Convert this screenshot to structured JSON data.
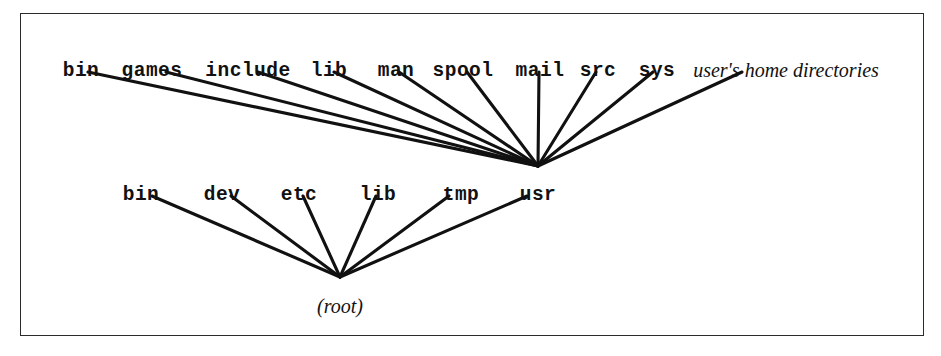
{
  "figure": {
    "frame": {
      "x": 20,
      "y": 13,
      "width": 904,
      "height": 323,
      "border_color": "#2b2b2b"
    },
    "background_color": "#ffffff",
    "line_color": "#111111"
  },
  "chart_data": {
    "type": "diagram",
    "subtype": "tree",
    "orientation": "bottom-up-fan",
    "nodes": [
      {
        "id": "root",
        "label": "(root)",
        "style": "italic-serif",
        "x": 340,
        "y": 296,
        "level": 0
      },
      {
        "id": "bin",
        "label": "bin",
        "style": "mono-bold",
        "x": 141,
        "y": 186,
        "level": 1
      },
      {
        "id": "dev",
        "label": "dev",
        "style": "mono-bold",
        "x": 222,
        "y": 186,
        "level": 1
      },
      {
        "id": "etc",
        "label": "etc",
        "style": "mono-bold",
        "x": 299,
        "y": 186,
        "level": 1
      },
      {
        "id": "lib",
        "label": "lib",
        "style": "mono-bold",
        "x": 378,
        "y": 186,
        "level": 1
      },
      {
        "id": "tmp",
        "label": "tmp",
        "style": "mono-bold",
        "x": 461,
        "y": 186,
        "level": 1
      },
      {
        "id": "usr",
        "label": "usr",
        "style": "mono-bold",
        "x": 538,
        "y": 186,
        "level": 1
      },
      {
        "id": "usr-bin",
        "label": "bin",
        "style": "mono-bold",
        "x": 81,
        "y": 62,
        "level": 2
      },
      {
        "id": "usr-games",
        "label": "games",
        "style": "mono-bold",
        "x": 152,
        "y": 62,
        "level": 2
      },
      {
        "id": "usr-include",
        "label": "include",
        "style": "mono-bold",
        "x": 248,
        "y": 62,
        "level": 2
      },
      {
        "id": "usr-lib",
        "label": "lib",
        "style": "mono-bold",
        "x": 329,
        "y": 62,
        "level": 2
      },
      {
        "id": "usr-man",
        "label": "man",
        "style": "mono-bold",
        "x": 396,
        "y": 62,
        "level": 2
      },
      {
        "id": "usr-spool",
        "label": "spool",
        "style": "mono-bold",
        "x": 463,
        "y": 62,
        "level": 2
      },
      {
        "id": "usr-mail",
        "label": "mail",
        "style": "mono-bold",
        "x": 540,
        "y": 62,
        "level": 2
      },
      {
        "id": "usr-src",
        "label": "src",
        "style": "mono-bold",
        "x": 598,
        "y": 62,
        "level": 2
      },
      {
        "id": "usr-sys",
        "label": "sys",
        "style": "mono-bold",
        "x": 657,
        "y": 62,
        "level": 2
      },
      {
        "id": "usr-home",
        "label": "user's home directories",
        "style": "italic-serif",
        "x": 786,
        "y": 60,
        "level": 2
      }
    ],
    "edges": [
      {
        "from": "bin",
        "to": "root",
        "x1": 152,
        "y1": 196,
        "x2": 340,
        "y2": 277
      },
      {
        "from": "dev",
        "to": "root",
        "x1": 231,
        "y1": 196,
        "x2": 340,
        "y2": 277
      },
      {
        "from": "etc",
        "to": "root",
        "x1": 303,
        "y1": 196,
        "x2": 340,
        "y2": 277
      },
      {
        "from": "lib",
        "to": "root",
        "x1": 376,
        "y1": 196,
        "x2": 340,
        "y2": 277
      },
      {
        "from": "tmp",
        "to": "root",
        "x1": 449,
        "y1": 196,
        "x2": 340,
        "y2": 277
      },
      {
        "from": "usr",
        "to": "root",
        "x1": 527,
        "y1": 196,
        "x2": 340,
        "y2": 277
      },
      {
        "from": "usr-bin",
        "to": "usr",
        "x1": 88,
        "y1": 72,
        "x2": 538,
        "y2": 166
      },
      {
        "from": "usr-games",
        "to": "usr",
        "x1": 166,
        "y1": 72,
        "x2": 538,
        "y2": 166
      },
      {
        "from": "usr-include",
        "to": "usr",
        "x1": 258,
        "y1": 72,
        "x2": 538,
        "y2": 166
      },
      {
        "from": "usr-lib",
        "to": "usr",
        "x1": 334,
        "y1": 72,
        "x2": 538,
        "y2": 166
      },
      {
        "from": "usr-man",
        "to": "usr",
        "x1": 399,
        "y1": 72,
        "x2": 538,
        "y2": 166
      },
      {
        "from": "usr-spool",
        "to": "usr",
        "x1": 467,
        "y1": 72,
        "x2": 538,
        "y2": 166
      },
      {
        "from": "usr-mail",
        "to": "usr",
        "x1": 539,
        "y1": 72,
        "x2": 538,
        "y2": 166
      },
      {
        "from": "usr-src",
        "to": "usr",
        "x1": 596,
        "y1": 72,
        "x2": 538,
        "y2": 166
      },
      {
        "from": "usr-sys",
        "to": "usr",
        "x1": 653,
        "y1": 72,
        "x2": 538,
        "y2": 166
      },
      {
        "from": "usr-home",
        "to": "usr",
        "x1": 742,
        "y1": 72,
        "x2": 538,
        "y2": 166
      }
    ]
  }
}
